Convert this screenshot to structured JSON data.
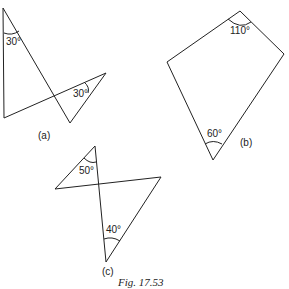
{
  "figure": {
    "caption": "Fig. 17.53",
    "parts": [
      {
        "label": "(a)",
        "angles": [
          "30°",
          "30°"
        ]
      },
      {
        "label": "(b)",
        "angles": [
          "110°",
          "60°"
        ]
      },
      {
        "label": "(c)",
        "angles": [
          "50°",
          "40°"
        ]
      }
    ]
  },
  "colors": {
    "stroke": "#222222",
    "background": "#ffffff"
  }
}
